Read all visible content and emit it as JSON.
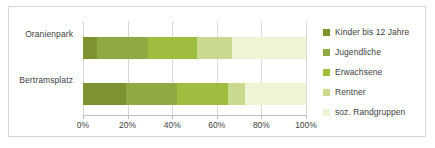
{
  "chart_data": {
    "type": "bar",
    "orientation": "horizontal",
    "stacked": true,
    "normalized": true,
    "title": "",
    "xlabel": "",
    "ylabel": "",
    "xlim": [
      0,
      100
    ],
    "grid": true,
    "legend_position": "right",
    "categories": [
      "Oranienpark",
      "Bertramsplatz"
    ],
    "xticks": [
      0,
      20,
      40,
      60,
      80,
      100
    ],
    "xtick_labels": [
      "0%",
      "20%",
      "40%",
      "60%",
      "80%",
      "100%"
    ],
    "series": [
      {
        "name": "Kinder bis 12 Jahre",
        "color": "#7d9331",
        "values": [
          6.5,
          19.5
        ]
      },
      {
        "name": "Jugendliche",
        "color": "#8faa43",
        "values": [
          22.5,
          22.5
        ]
      },
      {
        "name": "Erwachsene",
        "color": "#9fbd3f",
        "values": [
          22.0,
          23.0
        ]
      },
      {
        "name": "Rentner",
        "color": "#c9d98e",
        "values": [
          16.0,
          7.5
        ]
      },
      {
        "name": "soz. Randgruppen",
        "color": "#eef4d4",
        "values": [
          33.0,
          27.5
        ]
      }
    ]
  },
  "colors": {
    "frame_border": "#d8d8d8",
    "gridline": "#d9d9d9",
    "axis": "#bfbfbf",
    "text": "#3f3f3f"
  }
}
